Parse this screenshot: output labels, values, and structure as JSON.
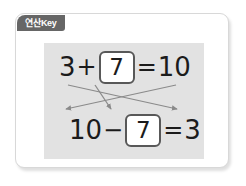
{
  "card": {
    "badge_label": "연산Key",
    "badge_color": "#666666",
    "badge_text_color": "#ffffff",
    "panel_color": "#e2e2e2",
    "border_color": "#d8d8d8"
  },
  "equations": {
    "top": {
      "left_operand": "3",
      "operator": "+",
      "answer_box_value": "7",
      "equals": "=",
      "result": "10"
    },
    "bottom": {
      "left_operand": "10",
      "operator": "−",
      "answer_box_value": "7",
      "equals": "=",
      "result": "3"
    }
  },
  "arrows": {
    "count": 3,
    "color": "#8a8a8a",
    "descriptions": [
      "from-3-to-bottom-right-3",
      "from-10-to-bottom-left-10",
      "from-top-box-7-to-bottom-box-7"
    ]
  }
}
